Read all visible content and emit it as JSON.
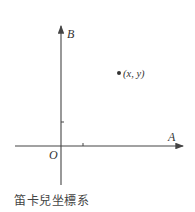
{
  "figure": {
    "x_axis_label": "A",
    "y_axis_label": "B",
    "origin_label": "O",
    "point_label": "(x, y)",
    "caption": "笛卡兒坐標系",
    "axis_color": "#444444"
  }
}
